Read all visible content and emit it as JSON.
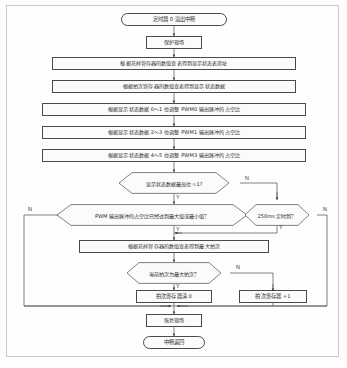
{
  "diagram": {
    "type": "flowchart",
    "language": "zh",
    "nodes": [
      {
        "id": "start",
        "shape": "terminal",
        "text": "定时器 0 溢出中断"
      },
      {
        "id": "save",
        "shape": "process",
        "text": "保护现场"
      },
      {
        "id": "lookup_addr",
        "shape": "process",
        "text": "根据花样寄存器的数值查表得到显示状态表首址"
      },
      {
        "id": "lookup_data",
        "shape": "process",
        "text": "根据拍次寄存器的数值查表得到显示状态数据"
      },
      {
        "id": "pwm0",
        "shape": "process",
        "text": "根据显示状态数据 0～1 位调整 PWM0 输出脉冲的占空比"
      },
      {
        "id": "pwm1",
        "shape": "process",
        "text": "根据显示状态数据 2～3 位调整 PWM1 输出脉冲的占空比"
      },
      {
        "id": "pwm3",
        "shape": "process",
        "text": "根据显示状态数据 4～5 位调整 PWM3 输出脉冲的占空比"
      },
      {
        "id": "msb",
        "shape": "decision",
        "text": "显示状态数据最高位 =1?"
      },
      {
        "id": "duty_limit",
        "shape": "decision",
        "text": "PWM 输出脉冲的占空比已经达到最大值或最小值？"
      },
      {
        "id": "timer250",
        "shape": "decision",
        "text": "250ms 定时到？"
      },
      {
        "id": "max_beat",
        "shape": "process",
        "text": "根据花样寄存器的数值查表得到最大拍次"
      },
      {
        "id": "is_max",
        "shape": "decision",
        "text": "当前拍次为最大拍次？"
      },
      {
        "id": "clear_beat",
        "shape": "process",
        "text": "拍次寄存器清 0"
      },
      {
        "id": "inc_beat",
        "shape": "process",
        "text": "拍次寄存器 +1"
      },
      {
        "id": "restore",
        "shape": "process",
        "text": "恢复现场"
      },
      {
        "id": "return",
        "shape": "terminal",
        "text": "中断返回"
      }
    ],
    "edge_labels": {
      "msb_no": "N",
      "msb_yes": "Y",
      "duty_no": "N",
      "duty_yes": "Y",
      "timer_no": "N",
      "timer_yes": "Y",
      "ismax_no": "N",
      "ismax_yes": "Y"
    },
    "colors": {
      "stroke": "#4a4a4a",
      "arrow": "#3a3a3a",
      "node_fill": "#fbfbfb",
      "page_bg": "#fdfdfd",
      "frame": "#c9c9c9",
      "text": "#2a2a2a"
    }
  }
}
